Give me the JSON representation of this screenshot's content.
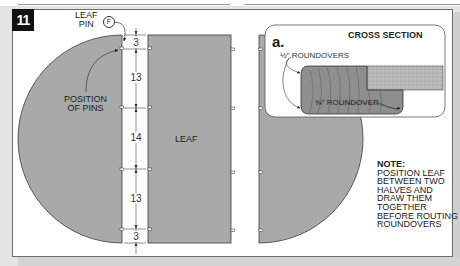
{
  "figure": {
    "number": "11",
    "colors": {
      "part_fill": "#a9a9a9",
      "outline": "#444444",
      "badge_bg": "#111111",
      "frame_bg": "#ffffff"
    }
  },
  "labels": {
    "leaf_pin_line1": "LEAF",
    "leaf_pin_line2": "PIN",
    "leaf_pin_callout": "F",
    "position_of_pins_line1": "POSITION",
    "position_of_pins_line2": "OF PINS",
    "leaf": "LEAF"
  },
  "dimensions": [
    "3",
    "13",
    "14",
    "13",
    "3"
  ],
  "cross_section": {
    "detail_letter": "a.",
    "title": "CROSS SECTION",
    "label_half_roundovers": "½\" ROUNDOVERS",
    "label_three_eighths_roundover": "⅜\" ROUNDOVER"
  },
  "note": {
    "heading": "NOTE:",
    "lines": [
      "POSITION LEAF",
      "BETWEEN TWO",
      "HALVES AND",
      "DRAW THEM",
      "TOGETHER",
      "BEFORE ROUTING",
      "ROUNDOVERS"
    ]
  }
}
